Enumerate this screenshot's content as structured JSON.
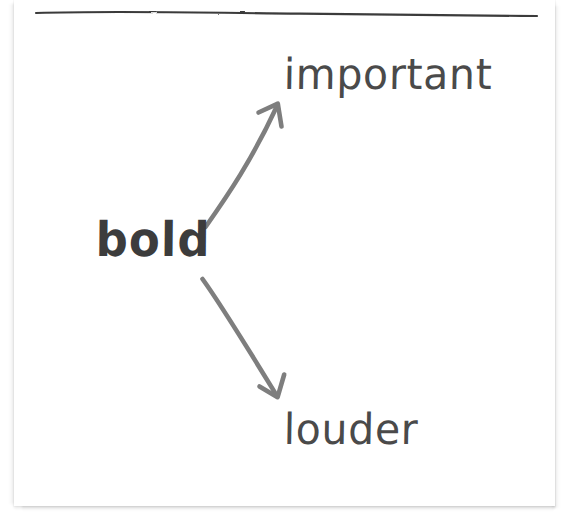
{
  "page": {
    "background_color": "#ffffff",
    "card_color": "#ffffff",
    "kind": "hand-drawn sketch note"
  },
  "divider": {
    "name": "hand-drawn horizontal rule",
    "color": "#3a3a3a",
    "x_start": 36,
    "y_start": 12,
    "x_end": 537,
    "y_end": 16
  },
  "diagram": {
    "type": "node-arrow concept map",
    "source_node": {
      "label": "bold",
      "color": "#3c3c3c",
      "weight": "bold",
      "x": 96,
      "y": 216
    },
    "target_nodes": [
      {
        "label": "important",
        "color": "#4a4a4a",
        "weight": "regular",
        "x": 284,
        "y": 54,
        "direction": "upper-right"
      },
      {
        "label": "louder",
        "color": "#4a4a4a",
        "weight": "regular",
        "x": 284,
        "y": 409,
        "direction": "lower-right"
      }
    ],
    "arrows": [
      {
        "name": "arrow-bold-to-important",
        "from": [
          205,
          227
        ],
        "to": [
          278,
          104
        ],
        "color": "#7e7e7e",
        "style": "hand-drawn, single head"
      },
      {
        "name": "arrow-bold-to-louder",
        "from": [
          202,
          279
        ],
        "to": [
          278,
          397
        ],
        "color": "#7e7e7e",
        "style": "hand-drawn, single head"
      }
    ]
  }
}
